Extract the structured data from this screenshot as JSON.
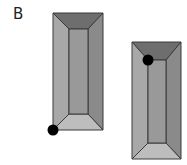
{
  "panel_label": "B",
  "colors": {
    "top": "#6e6e6e",
    "left": "#a8a8a8",
    "right": "#8a8a8a",
    "bottom": "#bdbdbd",
    "inner": "#999999",
    "stroke": "#3a3a3a",
    "dot": "#000000"
  },
  "shapes": [
    {
      "name": "left-frustum",
      "outer": [
        53,
        13,
        103,
        130
      ],
      "inner": [
        69,
        29,
        88,
        114
      ],
      "dot": [
        53,
        130
      ]
    },
    {
      "name": "right-frustum",
      "outer": [
        132,
        42,
        181,
        159
      ],
      "inner": [
        148,
        60,
        166,
        143
      ],
      "dot": [
        148,
        60
      ]
    }
  ]
}
